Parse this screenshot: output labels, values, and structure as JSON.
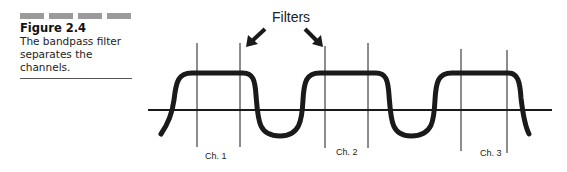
{
  "caption": {
    "figure_label": "Figure 2.4",
    "text": "The bandpass filter separates the channels."
  },
  "diagram": {
    "annotation": "Filters",
    "channels": [
      {
        "label": "Ch. 1"
      },
      {
        "label": "Ch. 2"
      },
      {
        "label": "Ch. 3"
      }
    ]
  },
  "colors": {
    "ink": "#1a1a1a",
    "decor_bar": "#9a9a9a"
  }
}
